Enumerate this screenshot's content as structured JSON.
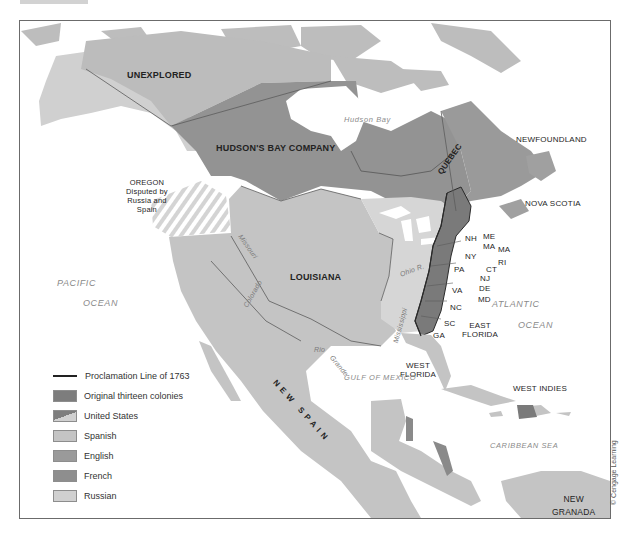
{
  "map": {
    "title": "",
    "credit": "© Cengage Learning",
    "colors": {
      "colonies": "#7d7d7d",
      "english": "#9a9a9a",
      "french": "#8e8e8e",
      "spanish": "#c4c4c4",
      "russian": "#d0d0d0",
      "unexplored": "#b8b8b8",
      "water": "#ffffff",
      "proclamation_line": "#2a2a2a"
    },
    "regions": {
      "unexplored": "UNEXPLORED",
      "hudsons_bay_company": "HUDSON'S BAY COMPANY",
      "quebec": "QUEBEC",
      "newfoundland": "NEWFOUNDLAND",
      "nova_scotia": "NOVA SCOTIA",
      "oregon": [
        "OREGON",
        "Disputed by",
        "Russia and",
        "Spain"
      ],
      "louisiana": "LOUISIANA",
      "new_spain": "NEW SPAIN",
      "west_florida": [
        "WEST",
        "FLORIDA"
      ],
      "east_florida": [
        "EAST",
        "FLORIDA"
      ],
      "west_indies": "WEST INDIES",
      "new_granada": [
        "NEW",
        "GRANADA"
      ]
    },
    "colonies": [
      "ME",
      "MA",
      "NH",
      "NY",
      "MA",
      "RI",
      "CT",
      "PA",
      "NJ",
      "DE",
      "MD",
      "VA",
      "NC",
      "SC",
      "GA"
    ],
    "water_bodies": {
      "hudson_bay": "Hudson Bay",
      "pacific": [
        "PACIFIC",
        "OCEAN"
      ],
      "atlantic": [
        "ATLANTIC",
        "OCEAN"
      ],
      "gulf_of_mexico": "GULF OF MEXICO",
      "caribbean": "CARIBBEAN SEA"
    },
    "rivers": {
      "missouri": "Missouri",
      "missouri_r": "R.",
      "ohio": "Ohio R.",
      "mississippi": "Mississippi",
      "mississippi_r": "R.",
      "colorado": "Colorado",
      "colorado_r": "R.",
      "rio": "Rio",
      "grande": "Grande"
    }
  },
  "legend": {
    "items": [
      {
        "type": "line",
        "label": "Proclamation Line of 1763"
      },
      {
        "type": "swatch",
        "label": "Original thirteen colonies",
        "color": "#7d7d7d"
      },
      {
        "type": "split",
        "label": "United States",
        "color": "#7d7d7d",
        "color2": "#d0d0d0"
      },
      {
        "type": "swatch",
        "label": "Spanish",
        "color": "#c4c4c4"
      },
      {
        "type": "swatch",
        "label": "English",
        "color": "#9a9a9a"
      },
      {
        "type": "swatch",
        "label": "French",
        "color": "#8e8e8e"
      },
      {
        "type": "swatch",
        "label": "Russian",
        "color": "#d0d0d0"
      }
    ]
  }
}
